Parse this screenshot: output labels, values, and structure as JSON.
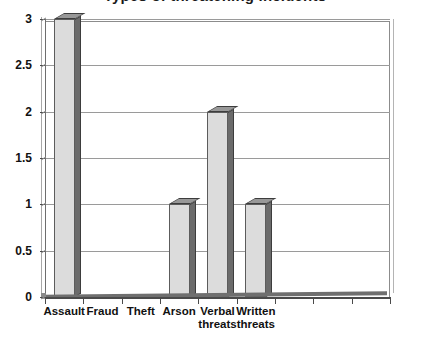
{
  "chart_data": {
    "type": "bar",
    "title": "Types of threatening incidents",
    "title_note": "title cropped at top edge of image",
    "xlabel": "",
    "ylabel": "",
    "categories": [
      "Assault",
      "Fraud",
      "Theft",
      "Arson",
      "Verbal\nthreats",
      "Written\nthreats",
      "",
      "",
      ""
    ],
    "values": [
      3,
      0,
      0,
      1,
      2,
      1,
      0,
      0,
      0
    ],
    "ylim": [
      0,
      3
    ],
    "ytick_labels": [
      "0",
      "0.5",
      "1",
      "1.5",
      "2",
      "2.5",
      "3"
    ],
    "ytick_values": [
      0,
      0.5,
      1,
      1.5,
      2,
      2.5,
      3
    ],
    "grid": true,
    "legend": false,
    "style": "3d-bar",
    "colors": {
      "bar_face": "#dcdcdc",
      "bar_side": "#6b6b6b",
      "bar_top": "#989898",
      "bar_outline": "#5c5c5c",
      "gridline": "#9a9a9a",
      "axis": "#4a4a4a",
      "plot_border": "#8c8c8c",
      "background": "#ffffff",
      "text": "#111111"
    }
  }
}
